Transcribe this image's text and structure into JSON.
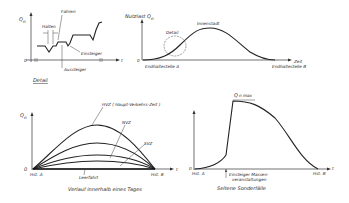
{
  "panels": {
    "detail": {
      "y_axis_label": "Q",
      "y_axis_sub": "n",
      "origin_label": "0",
      "x_axis_label": "t",
      "annotations": {
        "halten": "Halten",
        "fahren": "Fahren",
        "einsteiger": "Einsteiger",
        "aussteiger": "Aussteiger"
      },
      "caption": "Detail"
    },
    "route": {
      "y_axis_label": "Nutzlast Q",
      "y_axis_sub": "n",
      "origin_label": "0",
      "x_axis_label": "Zeit",
      "peak_label": "Innenstadt",
      "detail_marker": "Detail",
      "start_label": "Endhaltestelle A",
      "end_label": "Endhaltestelle B"
    },
    "daily": {
      "y_axis_label": "Q",
      "y_axis_sub": "n",
      "origin_label": "0",
      "x_axis_label": "t",
      "curves": [
        {
          "name": "HVZ",
          "label": "HVZ ( Haupt-Verkehrs-Zeit )"
        },
        {
          "name": "NVZ",
          "label": "NVZ"
        },
        {
          "name": "SVZ",
          "label": "SVZ"
        },
        {
          "name": "Leerfahrt",
          "label": "Leerfahrt"
        }
      ],
      "start_label": "Hst. A",
      "end_label": "Hst. B",
      "caption": "Verlauf innerhalb eines Tages"
    },
    "special": {
      "peak_label": "Q",
      "peak_sub": "n max",
      "origin_label": "0",
      "x_axis_label": "t",
      "start_label": "Hst. A",
      "end_label": "Hst. B",
      "event_label_line1": "Einsteiger Massen-",
      "event_label_line2": "veranstaltungen",
      "caption": "Seltene Sonderfälle"
    }
  }
}
